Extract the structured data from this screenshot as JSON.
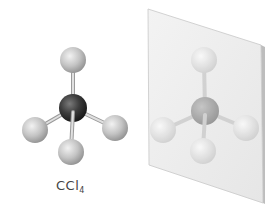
{
  "figure": {
    "molecule_label": "CCl",
    "molecule_subscript": "4",
    "colors": {
      "carbon": "#3a3a3a",
      "chlorine": "#bdbdbd",
      "bond": "#cfcfcf",
      "mirror": "#ececec",
      "mirror_edge": "#b5b5b5"
    },
    "atoms": [
      {
        "element": "C",
        "role": "central"
      },
      {
        "element": "Cl",
        "role": "top"
      },
      {
        "element": "Cl",
        "role": "left"
      },
      {
        "element": "Cl",
        "role": "right"
      },
      {
        "element": "Cl",
        "role": "front"
      }
    ]
  }
}
